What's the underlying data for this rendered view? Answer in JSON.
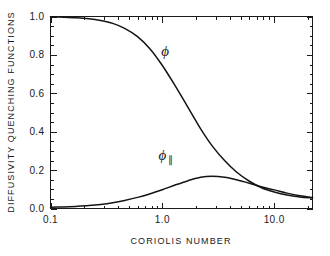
{
  "chart_data": {
    "type": "line",
    "title": "",
    "xlabel": "CORIOLIS NUMBER",
    "ylabel": "DIFFUSIVITY QUENCHING FUNCTIONS",
    "xscale": "log",
    "yscale": "linear",
    "xlim": [
      0.1,
      22.0
    ],
    "ylim": [
      0.0,
      1.0
    ],
    "grid": false,
    "legend_position": "inline-annotations",
    "xticks": [
      0.1,
      1.0,
      10.0
    ],
    "xticklabels": [
      "0.1",
      "1.0",
      "10.0"
    ],
    "yticks": [
      0.0,
      0.2,
      0.4,
      0.6,
      0.8,
      1.0
    ],
    "yticklabels": [
      "0.0",
      "0.2",
      "0.4",
      "0.6",
      "0.8",
      "1.0"
    ],
    "series": [
      {
        "name": "phi",
        "label": "ϕ",
        "label_sub": "",
        "color": "#141414",
        "x": [
          0.1,
          0.13,
          0.17,
          0.22,
          0.28,
          0.36,
          0.46,
          0.6,
          0.78,
          1.0,
          1.3,
          1.7,
          2.2,
          2.8,
          3.6,
          4.6,
          6.0,
          7.8,
          10.0,
          13.0,
          17.0,
          22.0
        ],
        "y": [
          0.998,
          0.996,
          0.993,
          0.988,
          0.979,
          0.964,
          0.938,
          0.895,
          0.83,
          0.745,
          0.64,
          0.525,
          0.415,
          0.325,
          0.25,
          0.19,
          0.142,
          0.107,
          0.086,
          0.07,
          0.06,
          0.055
        ]
      },
      {
        "name": "phi_parallel",
        "label": "ϕ",
        "label_sub": "∥",
        "color": "#141414",
        "x": [
          0.1,
          0.13,
          0.17,
          0.22,
          0.28,
          0.36,
          0.46,
          0.6,
          0.78,
          1.0,
          1.3,
          1.7,
          2.2,
          2.8,
          3.6,
          4.6,
          6.0,
          7.8,
          10.0,
          13.0,
          17.0,
          22.0
        ],
        "y": [
          0.006,
          0.008,
          0.011,
          0.015,
          0.021,
          0.03,
          0.042,
          0.058,
          0.077,
          0.098,
          0.122,
          0.145,
          0.163,
          0.168,
          0.163,
          0.15,
          0.132,
          0.112,
          0.097,
          0.08,
          0.066,
          0.057
        ]
      }
    ],
    "annotations": [
      {
        "name": "phi-label",
        "text": "ϕ",
        "sub": "",
        "x": 1.06,
        "y": 0.795
      },
      {
        "name": "phi-parallel-label",
        "text": "ϕ",
        "sub": "∥",
        "x": 1.0,
        "y": 0.255
      }
    ]
  },
  "axes": {
    "x_title": "CORIOLIS NUMBER",
    "y_title": "DIFFUSIVITY QUENCHING FUNCTIONS"
  }
}
